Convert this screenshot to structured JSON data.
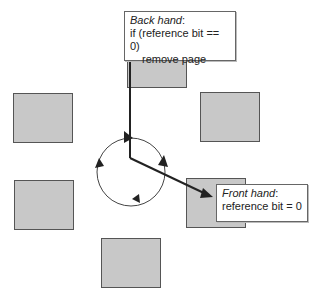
{
  "diagram": {
    "back_hand": {
      "title": "Back hand",
      "colon": ":",
      "line1": "if (reference bit == 0)",
      "line2": "remove page"
    },
    "front_hand": {
      "title": "Front hand",
      "colon": ":",
      "line1": "reference bit = 0"
    },
    "pages": [
      {
        "name": "page-top"
      },
      {
        "name": "page-upper-right"
      },
      {
        "name": "page-lower-right"
      },
      {
        "name": "page-bottom"
      },
      {
        "name": "page-lower-left"
      },
      {
        "name": "page-upper-left"
      }
    ],
    "colors": {
      "page_fill": "#c8c8c8",
      "line": "#222222",
      "callout_border": "#666666"
    }
  }
}
